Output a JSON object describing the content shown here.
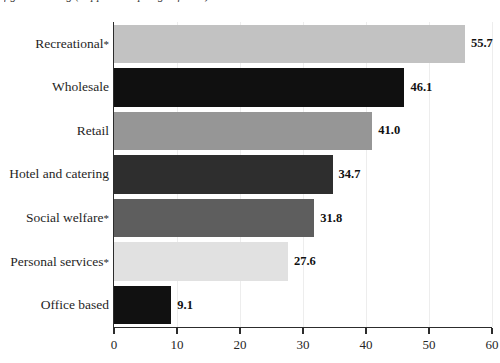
{
  "caption": "figure heading (clipped at top edge of scan)",
  "chart_data": {
    "type": "bar",
    "orientation": "horizontal",
    "title": "",
    "subtitle": "",
    "xlabel": "",
    "ylabel": "",
    "xlim": [
      0,
      60
    ],
    "ylim": null,
    "grid": true,
    "grid_axis": "x",
    "legend": false,
    "legend_position": "none",
    "categories": [
      "Recreational*",
      "Wholesale",
      "Retail",
      "Hotel and catering",
      "Social welfare*",
      "Personal services*",
      "Office based"
    ],
    "values": [
      55.7,
      46.1,
      41.0,
      34.7,
      31.8,
      27.6,
      9.1
    ],
    "value_labels": [
      "55.7",
      "46.1",
      "41.0",
      "34.7",
      "31.8",
      "27.6",
      "9.1"
    ],
    "bar_colors": [
      "#c2c2c2",
      "#101010",
      "#969696",
      "#2e2e2e",
      "#5e5e5e",
      "#e1e1e1",
      "#111111"
    ],
    "xticks": [
      0,
      10,
      20,
      30,
      40,
      50,
      60
    ],
    "xtick_labels": [
      "0",
      "10",
      "20",
      "30",
      "40",
      "50",
      "60"
    ],
    "footnote_symbol": "*"
  },
  "axis": {
    "line_color": "#2c2c2c",
    "grid_color": "#ededed"
  }
}
